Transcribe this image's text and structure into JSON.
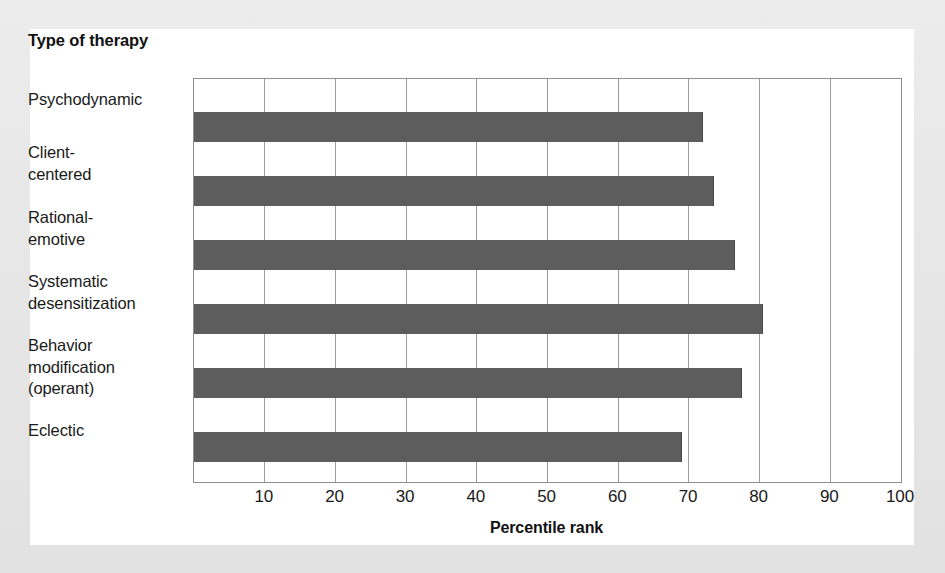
{
  "chart_data": {
    "type": "bar",
    "orientation": "horizontal",
    "title": "",
    "category_axis_title": "Type of\ntherapy",
    "categories": [
      "Psychodynamic",
      "Client-\ncentered",
      "Rational-\nemotive",
      "Systematic\ndesensitization",
      "Behavior\nmodification\n(operant)",
      "Eclectic"
    ],
    "values": [
      72,
      73.5,
      76.5,
      80.5,
      77.5,
      69
    ],
    "xlabel": "Percentile rank",
    "ylabel": "Type of therapy",
    "xlim": [
      0,
      100
    ],
    "xticks": [
      10,
      20,
      30,
      40,
      50,
      60,
      70,
      80,
      90,
      100
    ],
    "xtick_labels": [
      "10",
      "20",
      "30",
      "40",
      "50",
      "60",
      "70",
      "80",
      "90",
      "100"
    ],
    "grid": true,
    "grid_axis": "x",
    "legend": null,
    "bar_color": "#5d5d5d",
    "background_color": "#ffffff",
    "frame_color": "#e8e8e8"
  }
}
